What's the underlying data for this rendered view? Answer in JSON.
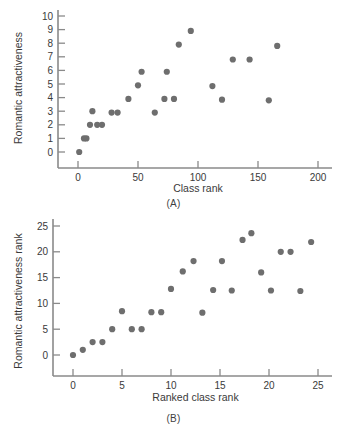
{
  "figure": {
    "panel_a_label": "(A)",
    "panel_b_label": "(B)"
  },
  "chart_data": [
    {
      "id": "A",
      "type": "scatter",
      "title": "",
      "panel_label": "(A)",
      "xlabel": "Class rank",
      "ylabel": "Romantic attractiveness",
      "xlim": [
        -10,
        210
      ],
      "ylim": [
        -1,
        10.6
      ],
      "xticks": [
        0,
        50,
        100,
        150,
        200
      ],
      "xtick_labels": [
        "0",
        "50",
        "100",
        "150",
        "200"
      ],
      "yticks": [
        0,
        1,
        2,
        3,
        4,
        5,
        6,
        7,
        8,
        9,
        10
      ],
      "ytick_labels": [
        "0",
        "1",
        "2",
        "3",
        "4",
        "5",
        "6",
        "7",
        "8",
        "9",
        "10"
      ],
      "grid": false,
      "legend": false,
      "marker_color": "#6e6e6e",
      "points": [
        {
          "x": 1,
          "y": 0.0
        },
        {
          "x": 5,
          "y": 1.0
        },
        {
          "x": 7,
          "y": 1.0
        },
        {
          "x": 10,
          "y": 2.0
        },
        {
          "x": 12,
          "y": 3.0
        },
        {
          "x": 16,
          "y": 2.0
        },
        {
          "x": 20,
          "y": 2.0
        },
        {
          "x": 28,
          "y": 2.9
        },
        {
          "x": 33,
          "y": 2.9
        },
        {
          "x": 42,
          "y": 3.9
        },
        {
          "x": 50,
          "y": 4.9
        },
        {
          "x": 53,
          "y": 5.9
        },
        {
          "x": 64,
          "y": 2.9
        },
        {
          "x": 72,
          "y": 3.9
        },
        {
          "x": 74,
          "y": 5.9
        },
        {
          "x": 80,
          "y": 3.9
        },
        {
          "x": 84,
          "y": 7.9
        },
        {
          "x": 94,
          "y": 8.9
        },
        {
          "x": 112,
          "y": 4.85
        },
        {
          "x": 120,
          "y": 3.85
        },
        {
          "x": 129,
          "y": 6.8
        },
        {
          "x": 143,
          "y": 6.8
        },
        {
          "x": 159,
          "y": 3.8
        },
        {
          "x": 166,
          "y": 7.8
        }
      ]
    },
    {
      "id": "B",
      "type": "scatter",
      "title": "",
      "panel_label": "(B)",
      "xlabel": "Ranked class rank",
      "ylabel": "Romantic attractiveness rank",
      "xlim": [
        -1.5,
        26.5
      ],
      "ylim": [
        -2.5,
        26.5
      ],
      "xticks": [
        0,
        5,
        10,
        15,
        20,
        25
      ],
      "xtick_labels": [
        "0",
        "5",
        "10",
        "15",
        "20",
        "25"
      ],
      "yticks": [
        0,
        5,
        10,
        15,
        20,
        25
      ],
      "ytick_labels": [
        "0",
        "5",
        "10",
        "15",
        "20",
        "25"
      ],
      "grid": false,
      "legend": false,
      "marker_color": "#6e6e6e",
      "points": [
        {
          "x": 0,
          "y": 0.0
        },
        {
          "x": 1,
          "y": 1.0
        },
        {
          "x": 2,
          "y": 2.5
        },
        {
          "x": 3,
          "y": 2.5
        },
        {
          "x": 4,
          "y": 5.0
        },
        {
          "x": 5,
          "y": 8.5
        },
        {
          "x": 6,
          "y": 5.0
        },
        {
          "x": 7,
          "y": 5.0
        },
        {
          "x": 8,
          "y": 8.3
        },
        {
          "x": 9,
          "y": 8.3
        },
        {
          "x": 10,
          "y": 12.8
        },
        {
          "x": 11.2,
          "y": 16.2
        },
        {
          "x": 12.3,
          "y": 18.2
        },
        {
          "x": 13.2,
          "y": 8.2
        },
        {
          "x": 14.3,
          "y": 12.6
        },
        {
          "x": 15.2,
          "y": 18.2
        },
        {
          "x": 16.2,
          "y": 12.5
        },
        {
          "x": 17.3,
          "y": 22.3
        },
        {
          "x": 18.2,
          "y": 23.6
        },
        {
          "x": 19.2,
          "y": 16.0
        },
        {
          "x": 20.2,
          "y": 12.5
        },
        {
          "x": 21.2,
          "y": 20.0
        },
        {
          "x": 22.2,
          "y": 20.0
        },
        {
          "x": 23.2,
          "y": 12.4
        },
        {
          "x": 24.3,
          "y": 21.9
        }
      ]
    }
  ]
}
